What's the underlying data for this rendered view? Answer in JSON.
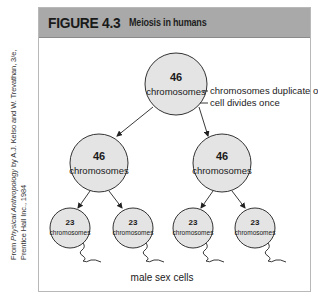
{
  "figure": {
    "number": "FIGURE 4.3",
    "title": "Meiosis in humans",
    "colors": {
      "header_bg": "#a9a9a9",
      "cell_fill": "#e4e4e4",
      "cell_stroke": "#333333",
      "border": "#b8b8b8"
    }
  },
  "credit": {
    "prefix": "From ",
    "book_title": "Physical Anthropology",
    "line1_rest": " by A.J. Kelso and W. Trevathan, 3/e,",
    "line2": "Prentice Hall Inc., 1984"
  },
  "diagram": {
    "parent_cell": {
      "count": "46",
      "label": "chromosomes"
    },
    "annotations": {
      "step1": "chromosomes duplicate once",
      "step2": "cell divides once"
    },
    "daughter_cells": [
      {
        "count": "46",
        "label": "chromosomes"
      },
      {
        "count": "46",
        "label": "chromosomes"
      }
    ],
    "sex_cells": [
      {
        "count": "23",
        "label": "chromosomes"
      },
      {
        "count": "23",
        "label": "chromosomes"
      },
      {
        "count": "23",
        "label": "chromosomes"
      },
      {
        "count": "23",
        "label": "chromosomes"
      }
    ],
    "caption": "male sex cells"
  }
}
